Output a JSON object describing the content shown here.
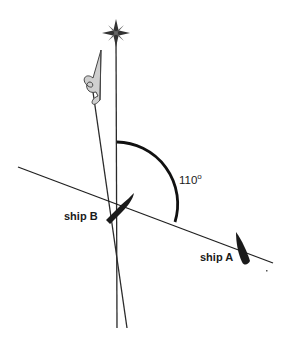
{
  "diagram": {
    "angle": {
      "value": "110",
      "unit_symbol": "o"
    },
    "ships": [
      {
        "id": "A",
        "label": "ship A"
      },
      {
        "id": "B",
        "label": "ship B"
      }
    ],
    "icons": {
      "compass": "compass-star-icon",
      "north_flag": "pennant-flag-icon"
    },
    "colors": {
      "ink": "#1a1a1a",
      "background": "#ffffff"
    }
  }
}
